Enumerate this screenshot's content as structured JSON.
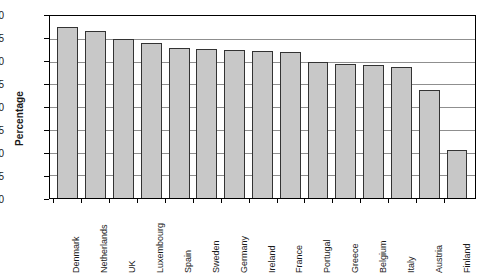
{
  "chart_data": {
    "type": "bar",
    "title": "",
    "xlabel": "",
    "ylabel": "Percentage",
    "ylim": [
      60,
      100
    ],
    "yticks": [
      60,
      65,
      70,
      75,
      80,
      85,
      90,
      95,
      100
    ],
    "grid": true,
    "legend": false,
    "categories": [
      "Denmark",
      "Netherlands",
      "UK",
      "Luxembourg",
      "Spain",
      "Sweden",
      "Germany",
      "Ireland",
      "France",
      "Portugal",
      "Greece",
      "Belgium",
      "Italy",
      "Austria",
      "Finland"
    ],
    "values": [
      97.5,
      96.8,
      95.0,
      94.0,
      93.0,
      92.7,
      92.5,
      92.4,
      92.2,
      89.8,
      89.5,
      89.3,
      88.7,
      83.8,
      70.5
    ],
    "bar_fill_color": "#c8c8c8",
    "bar_edge_color": "#333333",
    "gridline_color": "#8f8f8f",
    "axis_color": "#000000",
    "background_color": "#ffffff"
  }
}
